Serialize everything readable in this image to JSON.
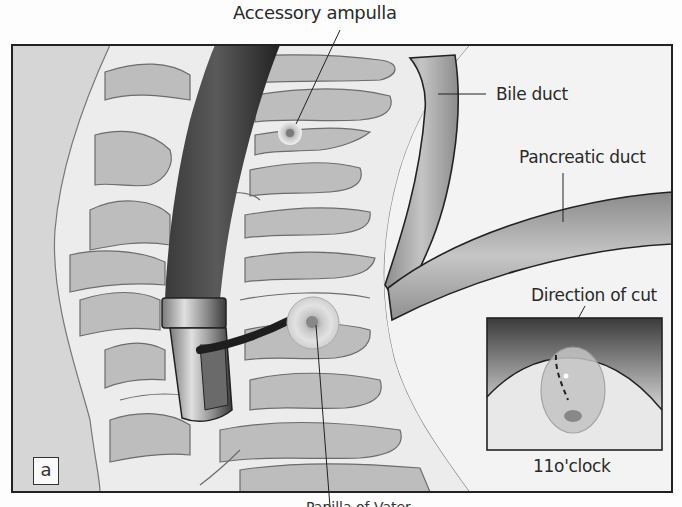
{
  "figure": {
    "panel_label": "a",
    "labels": {
      "accessory_ampulla": "Accessory ampulla",
      "bile_duct": "Bile duct",
      "pancreatic_duct": "Pancreatic duct",
      "direction_of_cut": "Direction of cut",
      "clock_position": "11o'clock",
      "major_papilla_cut": "Papilla of Vater"
    },
    "colors": {
      "background": "#d8d8d8",
      "frame": "#222222",
      "mucosa_light": "#ececec",
      "fold_gray": "#bdbdbd",
      "endoscope_dark": "#2e2e2e",
      "duct_gray": "#9a9a9a"
    }
  }
}
